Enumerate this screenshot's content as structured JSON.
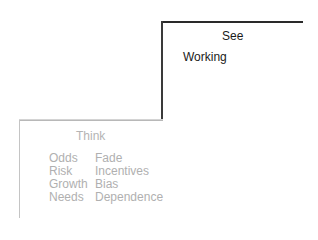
{
  "upper_step": {
    "title": "See",
    "items": [
      "Working"
    ]
  },
  "lower_step": {
    "title": "Think",
    "left_column": [
      "Odds",
      "Risk",
      "Growth",
      "Needs"
    ],
    "right_column": [
      "Fade",
      "Incentives",
      "Bias",
      "Dependence"
    ]
  },
  "colors": {
    "upper_line": "#2a2a2a",
    "lower_line": "#c4c4c4",
    "upper_text": "#1a1a1a",
    "lower_text": "#b0b0b0"
  }
}
